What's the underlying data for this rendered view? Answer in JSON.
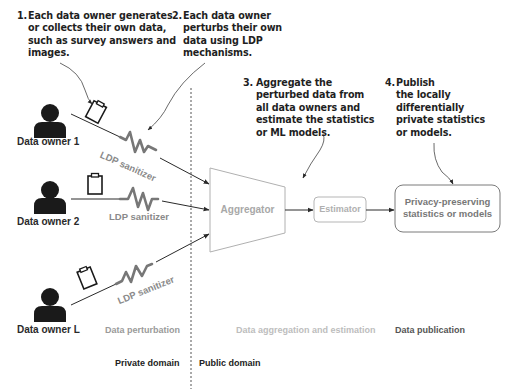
{
  "notes": [
    {
      "number": "1.",
      "lines": [
        "Each data owner generates",
        "or collects their own data,",
        "such as survey answers and",
        "images."
      ]
    },
    {
      "number": "2.",
      "lines": [
        "Each data owner",
        "perturbs their own",
        "data using LDP",
        "mechanisms."
      ]
    },
    {
      "number": "3.",
      "lines": [
        "Aggregate the",
        "perturbed data from",
        "all data owners and",
        "estimate the statistics",
        "or ML models."
      ]
    },
    {
      "number": "4.",
      "lines": [
        "Publish",
        "the locally",
        "differentially",
        "private statistics",
        "or models."
      ]
    }
  ],
  "owners": [
    {
      "label": "Data owner 1"
    },
    {
      "label": "Data owner 2"
    },
    {
      "label": "Data owner L"
    }
  ],
  "sanitizers": [
    {
      "label": "LDP sanitizer"
    },
    {
      "label": "LDP sanitizer"
    },
    {
      "label": "LDP sanitizer"
    }
  ],
  "components": {
    "aggregator": "Aggregator",
    "estimator": "Estimator",
    "output_line1": "Privacy-preserving",
    "output_line2": "statistics or models"
  },
  "phases": {
    "perturbation": "Data perturbation",
    "aggregation": "Data aggregation and estimation",
    "publication": "Data publication"
  },
  "domains": {
    "private": "Private domain",
    "public": "Public domain"
  },
  "colors": {
    "ink": "#1f1f1f",
    "person": "#1a1a1a",
    "sanitizer": "#777777",
    "light_box": "#b5b5b5",
    "output_box": "#7a7a7a"
  }
}
